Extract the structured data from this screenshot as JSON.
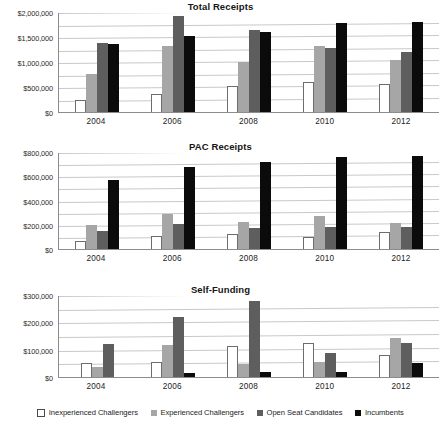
{
  "legend": {
    "items": [
      {
        "label": "Inexperienced Challengers",
        "color": "#ffffff",
        "swatch": "open-square"
      },
      {
        "label": "Experienced Challengers",
        "color": "#a6a6a6",
        "swatch": "filled-square"
      },
      {
        "label": "Open Seat Candidates",
        "color": "#5e5e5e",
        "swatch": "filled-square"
      },
      {
        "label": "Incumbents",
        "color": "#0b0b0b",
        "swatch": "filled-square"
      }
    ]
  },
  "chart_data": [
    {
      "type": "bar",
      "title": "Total Receipts",
      "xlabel": "",
      "ylabel": "",
      "categories": [
        "2004",
        "2006",
        "2008",
        "2010",
        "2012"
      ],
      "ylim": [
        0,
        2000000
      ],
      "yticks": [
        0,
        500000,
        1000000,
        1500000,
        2000000
      ],
      "ytick_labels": [
        "$0",
        "$500,000",
        "$1,000,000",
        "$1,500,000",
        "$2,000,000"
      ],
      "grid": true,
      "legend_position": "bottom-shared",
      "series": [
        {
          "name": "Inexperienced Challengers",
          "color": "#ffffff",
          "values": [
            250000,
            370000,
            520000,
            600000,
            570000
          ]
        },
        {
          "name": "Experienced Challengers",
          "color": "#a6a6a6",
          "values": [
            770000,
            1330000,
            1000000,
            1330000,
            1040000
          ]
        },
        {
          "name": "Open Seat Candidates",
          "color": "#5e5e5e",
          "values": [
            1390000,
            1920000,
            1640000,
            1290000,
            1200000
          ]
        },
        {
          "name": "Incumbents",
          "color": "#0b0b0b",
          "values": [
            1360000,
            1520000,
            1610000,
            1780000,
            1800000
          ]
        }
      ]
    },
    {
      "type": "bar",
      "title": "PAC Receipts",
      "xlabel": "",
      "ylabel": "",
      "categories": [
        "2004",
        "2006",
        "2008",
        "2010",
        "2012"
      ],
      "ylim": [
        0,
        800000
      ],
      "yticks": [
        0,
        200000,
        400000,
        600000,
        800000
      ],
      "ytick_labels": [
        "$0",
        "$200,000",
        "$400,000",
        "$600,000",
        "$800,000"
      ],
      "grid": true,
      "legend_position": "bottom-shared",
      "series": [
        {
          "name": "Inexperienced Challengers",
          "color": "#ffffff",
          "values": [
            70000,
            110000,
            125000,
            95000,
            140000
          ]
        },
        {
          "name": "Experienced Challengers",
          "color": "#a6a6a6",
          "values": [
            200000,
            285000,
            225000,
            275000,
            215000
          ]
        },
        {
          "name": "Open Seat Candidates",
          "color": "#5e5e5e",
          "values": [
            145000,
            205000,
            175000,
            185000,
            180000
          ]
        },
        {
          "name": "Incumbents",
          "color": "#0b0b0b",
          "values": [
            570000,
            680000,
            720000,
            760000,
            770000
          ]
        }
      ]
    },
    {
      "type": "bar",
      "title": "Self-Funding",
      "xlabel": "",
      "ylabel": "",
      "categories": [
        "2004",
        "2006",
        "2008",
        "2010",
        "2012"
      ],
      "ylim": [
        0,
        300000
      ],
      "yticks": [
        0,
        100000,
        200000,
        300000
      ],
      "ytick_labels": [
        "$0",
        "$100,000",
        "$200,000",
        "$300,000"
      ],
      "grid": true,
      "legend_position": "bottom-shared",
      "series": [
        {
          "name": "Inexperienced Challengers",
          "color": "#ffffff",
          "values": [
            52000,
            56000,
            112000,
            126000,
            80000
          ]
        },
        {
          "name": "Experienced Challengers",
          "color": "#a6a6a6",
          "values": [
            38000,
            117000,
            46000,
            56000,
            143000
          ]
        },
        {
          "name": "Open Seat Candidates",
          "color": "#5e5e5e",
          "values": [
            122000,
            218000,
            277000,
            88000,
            124000
          ]
        },
        {
          "name": "Incumbents",
          "color": "#0b0b0b",
          "values": [
            0,
            16000,
            20000,
            20000,
            52000
          ]
        }
      ]
    }
  ]
}
